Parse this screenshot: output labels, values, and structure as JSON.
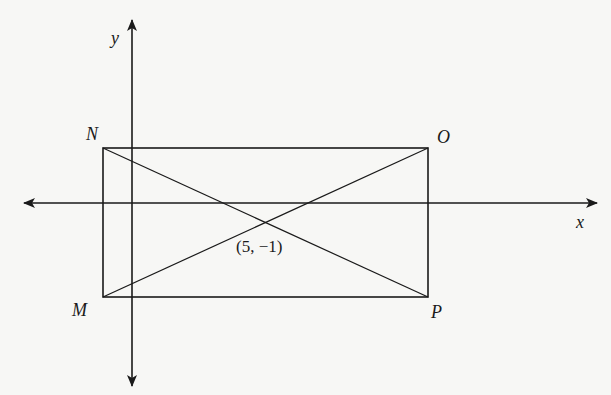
{
  "figure": {
    "type": "coordinate-plane-rectangle",
    "axes": {
      "x_label": "x",
      "y_label": "y"
    },
    "vertices": {
      "top_left": "N",
      "top_right": "O",
      "bottom_right": "P",
      "bottom_left": "M"
    },
    "diagonal_intersection_label": "(5, −1)",
    "colors": {
      "line": "#1a1a1a",
      "background": "#f7f7f5"
    }
  }
}
